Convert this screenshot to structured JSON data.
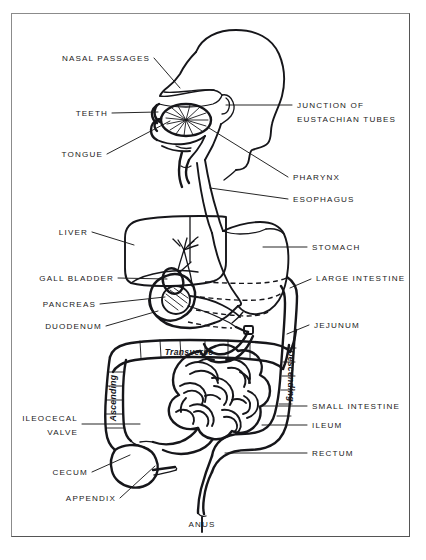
{
  "figure": {
    "background_color": "#ffffff",
    "ink_color": "#16161a",
    "border_color": "#8b8b8b"
  },
  "callouts": {
    "nasal_passages": "NASAL PASSAGES",
    "teeth": "TEETH",
    "tongue": "TONGUE",
    "junction_line1": "JUNCTION OF",
    "junction_line2": "EUSTACHIAN TUBES",
    "pharynx": "PHARYNX",
    "esophagus": "ESOPHAGUS",
    "liver": "LIVER",
    "stomach": "STOMACH",
    "gall_bladder": "GALL BLADDER",
    "large_intestine": "LARGE INTESTINE",
    "pancreas": "PANCREAS",
    "duodenum": "DUODENUM",
    "jejunum": "JEJUNUM",
    "small_intestine": "SMALL INTESTINE",
    "ileocecal_line1": "ILEOCECAL",
    "ileocecal_line2": "VALVE",
    "ileum": "ILEUM",
    "rectum": "RECTUM",
    "cecum": "CECUM",
    "appendix": "APPENDIX",
    "anus": "ANUS"
  },
  "region_labels": {
    "ascending": "Ascending",
    "transverse": "Transverse",
    "descending": "Descending"
  }
}
